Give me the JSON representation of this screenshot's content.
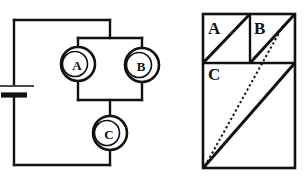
{
  "figure": {
    "title": "",
    "background_color": "#ffffff",
    "ink_color": "#111111",
    "panels": [
      {
        "id": "circuit",
        "name": "electrical-circuit-diagram"
      },
      {
        "id": "region",
        "name": "divided-rectangle-diagram"
      }
    ]
  },
  "circuit": {
    "name": "circuit-diagram",
    "battery": {
      "label": "",
      "symbol": "battery-cell"
    },
    "meters": [
      {
        "id": "A",
        "label": "A",
        "name": "meter-a",
        "cx": 78,
        "cy": 64,
        "r": 17
      },
      {
        "id": "B",
        "label": "B",
        "name": "meter-b",
        "cx": 142,
        "cy": 65,
        "r": 17
      },
      {
        "id": "C",
        "label": "C",
        "name": "meter-c",
        "cx": 110,
        "cy": 133,
        "r": 17
      }
    ],
    "topology": "battery in series with parallel pair A and B, then meter C in series"
  },
  "region": {
    "name": "region-diagram",
    "outer_rect": {
      "x": 13,
      "y": 14,
      "w": 92,
      "h": 154
    },
    "cells": [
      {
        "id": "A",
        "label": "A",
        "name": "region-cell-a",
        "label_x": 18,
        "label_y": 22,
        "diagonal": "bottom-left-to-top-right"
      },
      {
        "id": "B",
        "label": "B",
        "name": "region-cell-b",
        "label_x": 64,
        "label_y": 22,
        "diagonal": "bottom-left-to-top-right"
      },
      {
        "id": "C",
        "label": "C",
        "name": "region-cell-c",
        "label_x": 18,
        "label_y": 68,
        "diagonal": "bottom-left-to-top-right"
      }
    ],
    "dividers": {
      "horizontal_y": 63,
      "vertical_x": 60
    },
    "dotted_line": {
      "name": "dotted-diagonal-line",
      "from": "bottom-left-of-cell-c",
      "to": "upper-right-of-cell-b",
      "style": "dotted"
    }
  }
}
